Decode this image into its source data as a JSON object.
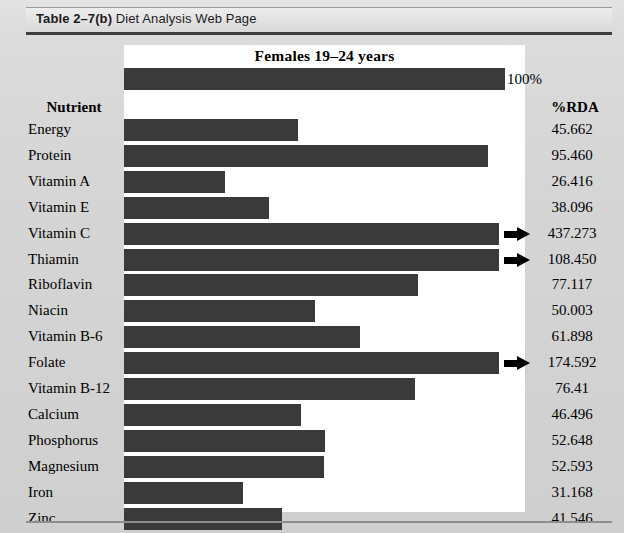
{
  "caption": {
    "number": "Table 2–7(b)",
    "title": "Diet Analysis Web Page"
  },
  "chart_data": {
    "type": "bar",
    "orientation": "horizontal",
    "title": "Females 19–24 years",
    "xlabel": "",
    "ylabel": "",
    "column_headers": {
      "category": "Nutrient",
      "value": "%RDA"
    },
    "reference": {
      "label": "100%",
      "value": 100
    },
    "xlim": [
      0,
      100
    ],
    "grid": false,
    "legend": null,
    "axis_max_displayed": 100,
    "overflow_marker": "arrow-right-icon",
    "categories": [
      "Energy",
      "Protein",
      "Vitamin A",
      "Vitamin E",
      "Vitamin C",
      "Thiamin",
      "Riboflavin",
      "Niacin",
      "Vitamin B-6",
      "Folate",
      "Vitamin B-12",
      "Calcium",
      "Phosphorus",
      "Magnesium",
      "Iron",
      "Zinc"
    ],
    "values": [
      45.662,
      95.46,
      26.416,
      38.096,
      437.273,
      108.45,
      77.117,
      50.003,
      61.898,
      174.592,
      76.41,
      46.496,
      52.648,
      52.593,
      31.168,
      41.546
    ],
    "value_labels": [
      "45.662",
      "95.460",
      "26.416",
      "38.096",
      "437.273",
      "108.450",
      "77.117",
      "50.003",
      "61.898",
      "174.592",
      "76.41",
      "46.496",
      "52.648",
      "52.593",
      "31.168",
      "41.546"
    ],
    "overflow": [
      false,
      false,
      false,
      false,
      true,
      true,
      false,
      false,
      false,
      true,
      false,
      false,
      false,
      false,
      false,
      false
    ],
    "colors": {
      "bar": "#3a3a3a",
      "panel": "#ffffff",
      "page": "#d6d6d6",
      "arrow": "#000000",
      "text": "#000000"
    }
  }
}
